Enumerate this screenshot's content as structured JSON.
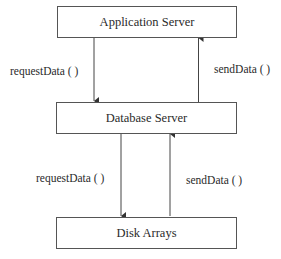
{
  "diagram": {
    "nodes": [
      {
        "id": "app",
        "label": "Application Server"
      },
      {
        "id": "db",
        "label": "Database Server"
      },
      {
        "id": "disk",
        "label": "Disk Arrays"
      }
    ],
    "edges": [
      {
        "from": "app",
        "to": "db",
        "label": "requestData ( )"
      },
      {
        "from": "db",
        "to": "app",
        "label": "sendData ( )"
      },
      {
        "from": "db",
        "to": "disk",
        "label": "requestData ( )"
      },
      {
        "from": "disk",
        "to": "db",
        "label": "sendData ( )"
      }
    ]
  }
}
